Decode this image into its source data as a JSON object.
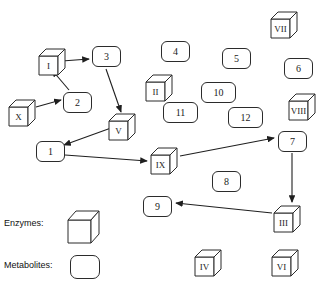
{
  "diagram": {
    "background_color": "#ffffff",
    "stroke_color": "#2b2b2b",
    "text_color": "#1a1a1a"
  },
  "enzymes": [
    {
      "id": "enzyme-I",
      "label": "I",
      "x": 38,
      "y": 48
    },
    {
      "id": "enzyme-X",
      "label": "X",
      "x": 8,
      "y": 99
    },
    {
      "id": "enzyme-V",
      "label": "V",
      "x": 108,
      "y": 113
    },
    {
      "id": "enzyme-II",
      "label": "II",
      "x": 145,
      "y": 74
    },
    {
      "id": "enzyme-VII",
      "label": "VII",
      "x": 270,
      "y": 11
    },
    {
      "id": "enzyme-VIII",
      "label": "VIII",
      "x": 288,
      "y": 93
    },
    {
      "id": "enzyme-IX",
      "label": "IX",
      "x": 150,
      "y": 147
    },
    {
      "id": "enzyme-III",
      "label": "III",
      "x": 273,
      "y": 205
    },
    {
      "id": "enzyme-IV",
      "label": "IV",
      "x": 194,
      "y": 249
    },
    {
      "id": "enzyme-VI",
      "label": "VI",
      "x": 271,
      "y": 249
    }
  ],
  "metabolites": [
    {
      "id": "metabolite-3",
      "label": "3",
      "x": 92,
      "y": 46,
      "wide": false
    },
    {
      "id": "metabolite-4",
      "label": "4",
      "x": 161,
      "y": 41,
      "wide": false
    },
    {
      "id": "metabolite-5",
      "label": "5",
      "x": 222,
      "y": 48,
      "wide": false
    },
    {
      "id": "metabolite-6",
      "label": "6",
      "x": 284,
      "y": 58,
      "wide": false
    },
    {
      "id": "metabolite-2",
      "label": "2",
      "x": 63,
      "y": 92,
      "wide": false
    },
    {
      "id": "metabolite-10",
      "label": "10",
      "x": 201,
      "y": 82,
      "wide": true
    },
    {
      "id": "metabolite-11",
      "label": "11",
      "x": 163,
      "y": 102,
      "wide": true
    },
    {
      "id": "metabolite-12",
      "label": "12",
      "x": 228,
      "y": 107,
      "wide": true
    },
    {
      "id": "metabolite-1",
      "label": "1",
      "x": 36,
      "y": 141,
      "wide": false
    },
    {
      "id": "metabolite-7",
      "label": "7",
      "x": 278,
      "y": 131,
      "wide": false
    },
    {
      "id": "metabolite-8",
      "label": "8",
      "x": 212,
      "y": 171,
      "wide": false
    },
    {
      "id": "metabolite-9",
      "label": "9",
      "x": 143,
      "y": 196,
      "wide": false
    }
  ],
  "arrows": [
    {
      "id": "arrow-I-to-3",
      "from": "I",
      "to": "3",
      "x1": 62,
      "y1": 61,
      "x2": 89,
      "y2": 59
    },
    {
      "id": "arrow-2-to-I",
      "from": "2",
      "to": "I",
      "x1": 69,
      "y1": 90,
      "x2": 52,
      "y2": 70
    },
    {
      "id": "arrow-X-to-2",
      "from": "X",
      "to": "2",
      "x1": 36,
      "y1": 107,
      "x2": 61,
      "y2": 100
    },
    {
      "id": "arrow-3-to-V",
      "from": "3",
      "to": "V",
      "x1": 106,
      "y1": 69,
      "x2": 121,
      "y2": 112
    },
    {
      "id": "arrow-V-to-1",
      "from": "V",
      "to": "1",
      "x1": 111,
      "y1": 128,
      "x2": 64,
      "y2": 145
    },
    {
      "id": "arrow-1-to-IX",
      "from": "1",
      "to": "IX",
      "x1": 65,
      "y1": 155,
      "x2": 147,
      "y2": 161
    },
    {
      "id": "arrow-IX-to-7",
      "from": "IX",
      "to": "7",
      "x1": 180,
      "y1": 156,
      "x2": 274,
      "y2": 138
    },
    {
      "id": "arrow-7-to-III",
      "from": "7",
      "to": "III",
      "x1": 292,
      "y1": 153,
      "x2": 292,
      "y2": 202
    },
    {
      "id": "arrow-III-to-9",
      "from": "III",
      "to": "9",
      "x1": 272,
      "y1": 213,
      "x2": 176,
      "y2": 203
    }
  ],
  "legend": {
    "enzymes_label": "Enzymes:",
    "metabolites_label": "Metabolites:",
    "enzymes_label_pos": {
      "x": 4,
      "y": 218
    },
    "metabolites_label_pos": {
      "x": 4,
      "y": 260
    },
    "enzymes_swatch_pos": {
      "x": 67,
      "y": 210
    },
    "metabolites_swatch_pos": {
      "x": 70,
      "y": 255
    }
  }
}
